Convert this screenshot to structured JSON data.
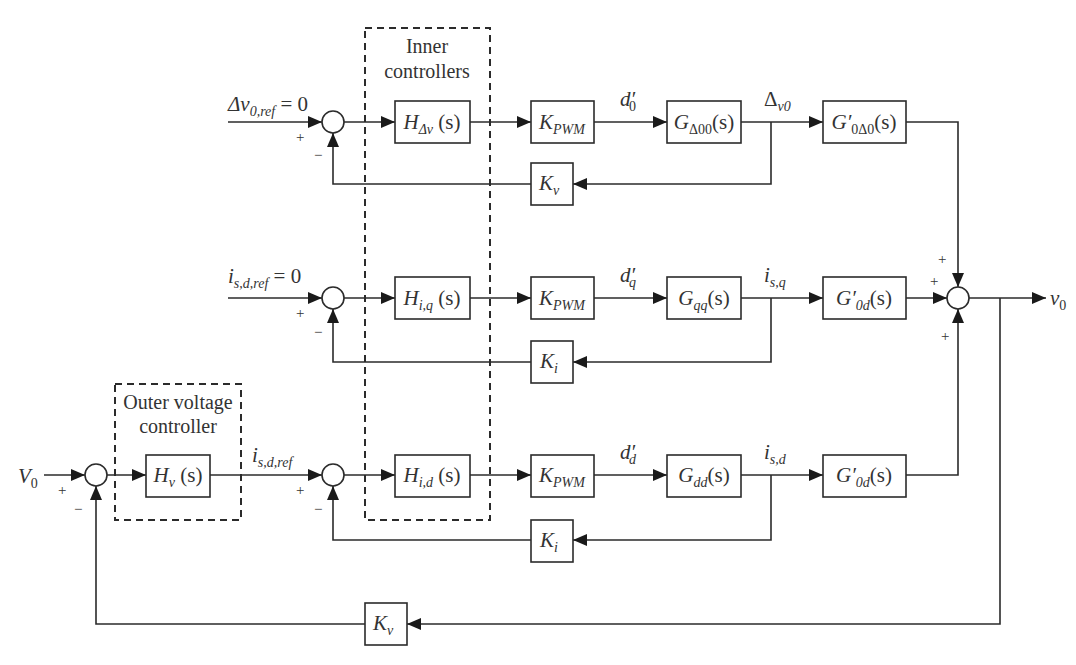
{
  "diagram": {
    "type": "control-block-diagram",
    "groups": {
      "inner": {
        "line1": "Inner",
        "line2": "controllers"
      },
      "outer": {
        "line1": "Outer voltage",
        "line2": "controller"
      }
    },
    "rows": [
      {
        "id": "delta-v",
        "input_label": {
          "main": "Δv",
          "sub": "0,ref",
          "suffix": " = 0"
        },
        "controller": {
          "main": "H",
          "sub": "Δv",
          "suffix": " (s)"
        },
        "pwm": {
          "main": "K",
          "sub": "PWM"
        },
        "duty": {
          "main": "d′",
          "sub": "0"
        },
        "plant": {
          "main": "G",
          "sub": "Δ00",
          "suffix": "(s)"
        },
        "state": {
          "main": "Δ",
          "sub": "v0"
        },
        "output_tf": {
          "main": "G′",
          "sub": "0Δ0",
          "suffix": "(s)"
        },
        "feedback": {
          "main": "K",
          "sub": "v"
        }
      },
      {
        "id": "q-axis",
        "input_label": {
          "main": "i",
          "sub": "s,d,ref",
          "suffix": " = 0"
        },
        "controller": {
          "main": "H",
          "sub": "i,q",
          "suffix": " (s)"
        },
        "pwm": {
          "main": "K",
          "sub": "PWM"
        },
        "duty": {
          "main": "d′",
          "sub": "q"
        },
        "plant": {
          "main": "G",
          "sub": "qq",
          "suffix": "(s)"
        },
        "state": {
          "main": "i",
          "sub": "s,q"
        },
        "output_tf": {
          "main": "G′",
          "sub": "0d",
          "suffix": "(s)"
        },
        "feedback": {
          "main": "K",
          "sub": "i"
        }
      },
      {
        "id": "d-axis",
        "input_label": {
          "main": "i",
          "sub": "s,d,ref",
          "suffix": ""
        },
        "controller": {
          "main": "H",
          "sub": "i,d",
          "suffix": " (s)"
        },
        "pwm": {
          "main": "K",
          "sub": "PWM"
        },
        "duty": {
          "main": "d′",
          "sub": "d"
        },
        "plant": {
          "main": "G",
          "sub": "dd",
          "suffix": "(s)"
        },
        "state": {
          "main": "i",
          "sub": "s,d"
        },
        "output_tf": {
          "main": "G′",
          "sub": "0d",
          "suffix": "(s)"
        },
        "feedback": {
          "main": "K",
          "sub": "i"
        }
      }
    ],
    "outer_loop": {
      "reference": {
        "main": "V",
        "sub": "0"
      },
      "controller": {
        "main": "H",
        "sub": "v",
        "suffix": " (s)"
      },
      "feedback": {
        "main": "K",
        "sub": "v"
      }
    },
    "output": {
      "main": "v",
      "sub": "0"
    },
    "signs": {
      "plus": "+",
      "minus": "−"
    }
  }
}
